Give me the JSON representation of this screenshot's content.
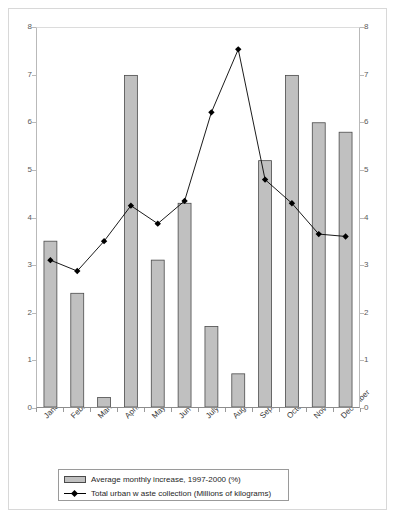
{
  "chart_data": {
    "type": "bar",
    "title": "",
    "subtitle": "",
    "xlabel": "",
    "ylabel": "",
    "ylim": [
      0,
      8
    ],
    "y2lim": [
      0,
      8
    ],
    "grid": false,
    "legend_position": "bottom",
    "categories": [
      "January",
      "February",
      "March",
      "April",
      "May",
      "Jun",
      "July",
      "August",
      "September",
      "October",
      "November",
      "December"
    ],
    "series": [
      {
        "name": "Average monthly increase, 1997-2000 (%)",
        "type": "bar",
        "axis": "left",
        "color": "#c0c0c0",
        "edge_color": "#4a4a4a",
        "values": [
          3.5,
          2.4,
          0.2,
          7.0,
          3.1,
          4.3,
          1.7,
          0.7,
          5.2,
          7.0,
          6.0,
          5.8
        ]
      },
      {
        "name": "Total urban w aste collection (Millions of kilograms)",
        "type": "line",
        "axis": "right",
        "color": "#000000",
        "marker": "diamond",
        "values": [
          3.1,
          2.87,
          3.5,
          4.25,
          3.87,
          4.35,
          6.22,
          7.55,
          4.8,
          4.3,
          3.65,
          3.6
        ]
      }
    ],
    "y_ticks_left": [
      "0",
      "1",
      "2",
      "3",
      "4",
      "5",
      "6",
      "7",
      "8"
    ],
    "y_ticks_right": [
      "0",
      "1",
      "2",
      "3",
      "4",
      "5",
      "6",
      "7",
      "8"
    ]
  },
  "axes": {
    "left_ticks": [
      {
        "value": 8,
        "label": "8"
      },
      {
        "value": 7,
        "label": "7"
      },
      {
        "value": 6,
        "label": "6"
      },
      {
        "value": 5,
        "label": "5"
      },
      {
        "value": 4,
        "label": "4"
      },
      {
        "value": 3,
        "label": "3"
      },
      {
        "value": 2,
        "label": "2"
      },
      {
        "value": 1,
        "label": "1"
      },
      {
        "value": 0,
        "label": "0"
      }
    ],
    "right_ticks": [
      {
        "value": 8,
        "label": "8"
      },
      {
        "value": 7,
        "label": "7"
      },
      {
        "value": 6,
        "label": "6"
      },
      {
        "value": 5,
        "label": "5"
      },
      {
        "value": 4,
        "label": "4"
      },
      {
        "value": 3,
        "label": "3"
      },
      {
        "value": 2,
        "label": "2"
      },
      {
        "value": 1,
        "label": "1"
      },
      {
        "value": 0,
        "label": "0"
      }
    ],
    "x_labels": [
      "January",
      "February",
      "March",
      "April",
      "May",
      "Jun",
      "July",
      "August",
      "September",
      "October",
      "November",
      "December"
    ]
  },
  "legend": {
    "items": [
      {
        "label": "Average monthly increase, 1997-2000 (%)",
        "marker": "bar-swatch"
      },
      {
        "label": "Total urban w aste collection (Millions of kilograms)",
        "marker": "line-diamond-swatch"
      }
    ]
  },
  "colors": {
    "bar_fill": "#c0c0c0",
    "bar_edge": "#4a4a4a",
    "line": "#000000",
    "axis": "#b9b9b9",
    "frame": "#d8d8d8",
    "background": "#ffffff"
  }
}
